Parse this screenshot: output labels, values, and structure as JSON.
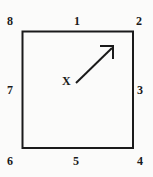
{
  "figure": {
    "name": "square-with-direction-arrow-diagram",
    "background_color": "#fbfbfa",
    "ink_color": "#1a1a1a",
    "width": 153,
    "height": 177,
    "square": {
      "left": 22,
      "top": 31,
      "right": 133,
      "bottom": 148,
      "stroke_width": 2
    },
    "point": {
      "label": "X",
      "x": 67,
      "y": 81
    },
    "arrow": {
      "tail_x": 76,
      "tail_y": 83,
      "tip_x": 113,
      "tip_y": 47,
      "stroke_width": 2,
      "head_style": "open-v",
      "direction": "up-right"
    },
    "labels": [
      {
        "id": "lbl-8",
        "text": "8",
        "position": "top-left-corner"
      },
      {
        "id": "lbl-1",
        "text": "1",
        "position": "top-edge"
      },
      {
        "id": "lbl-2",
        "text": "2",
        "position": "top-right-corner"
      },
      {
        "id": "lbl-3",
        "text": "3",
        "position": "right-edge"
      },
      {
        "id": "lbl-4",
        "text": "4",
        "position": "bottom-right-corner"
      },
      {
        "id": "lbl-5",
        "text": "5",
        "position": "bottom-edge"
      },
      {
        "id": "lbl-6",
        "text": "6",
        "position": "bottom-left-corner"
      },
      {
        "id": "lbl-7",
        "text": "7",
        "position": "left-edge"
      }
    ]
  }
}
